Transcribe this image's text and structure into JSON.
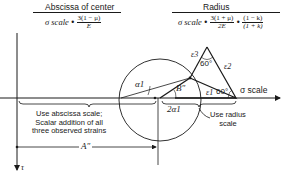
{
  "left_formula": {
    "title": "Abscissa of center",
    "scale_label": "σ scale",
    "dot": "•",
    "numerator": "3(1 − μ)",
    "denominator": "E"
  },
  "right_formula": {
    "title": "Radius",
    "scale_label": "σ scale",
    "dot": "•",
    "numerator1": "3(1 + μ)",
    "denominator1": "2E",
    "numerator2": "(1 − k)",
    "denominator2": "(1 + k)"
  },
  "axes": {
    "sigma_label": "σ scale",
    "tau_label": "τ"
  },
  "triangle": {
    "angle_top": "60°",
    "angle_right": "60°",
    "side_left": "ε3",
    "side_right": "ε2",
    "side_bottom": "ε1"
  },
  "labels": {
    "alpha1": "α1",
    "two_alpha1": "2α1",
    "b_double_prime": "B″",
    "a_double_prime": "A″",
    "use_radius_line1": "Use radius",
    "use_radius_line2": "scale",
    "abscissa_note_line1": "Use abscissa scale;",
    "abscissa_note_line2": "Scalar addition of all",
    "abscissa_note_line3": "three observed strains"
  },
  "colors": {
    "ink": "#1a1a1a",
    "background": "#ffffff"
  }
}
